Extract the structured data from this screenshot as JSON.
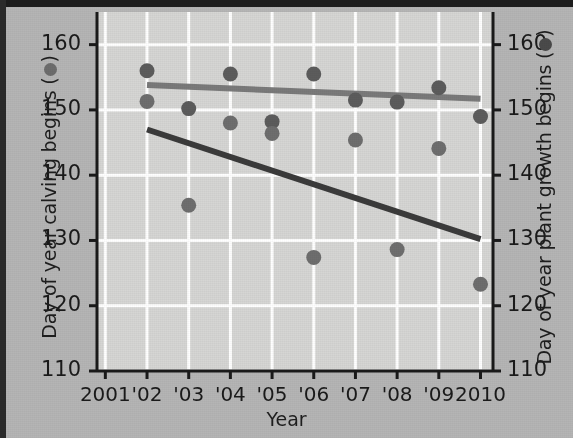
{
  "figure": {
    "background_color": "#b5b5b5",
    "plot_background_color": "#d6d6d4",
    "gridline_color": "#ffffff",
    "axis_color": "#1a1a1a"
  },
  "axes": {
    "x_label": "Year",
    "y_left_label_prefix": "Day of year calving begins (",
    "y_left_label_suffix": ")",
    "y_right_label_prefix": "Day of year plant growth begins (",
    "y_right_label_suffix": ")",
    "y_ticks": [
      "110",
      "120",
      "130",
      "140",
      "150",
      "160"
    ],
    "y_tick_values": [
      110,
      120,
      130,
      140,
      150,
      160
    ],
    "y_min": 110,
    "y_max": 165,
    "x_ticks": [
      "2001",
      "'02",
      "'03",
      "'04",
      "'05",
      "'06",
      "'07",
      "'08",
      "'09",
      "2010"
    ],
    "x_tick_values": [
      2001,
      2002,
      2003,
      2004,
      2005,
      2006,
      2007,
      2008,
      2009,
      2010
    ],
    "x_min": 2000.8,
    "x_max": 2010.3
  },
  "legend_symbols": {
    "calving_color": "#6d6d6d",
    "plant_growth_color": "#4a4a4a"
  },
  "chart_data": {
    "type": "scatter",
    "title": "",
    "xlabel": "Year",
    "ylabel": "Day of year calving begins",
    "ylabel_right": "Day of year plant growth begins",
    "xlim": [
      2000.8,
      2010.3
    ],
    "ylim": [
      110,
      165
    ],
    "grid": true,
    "legend_position": "axis-labels",
    "x": [
      2002,
      2003,
      2004,
      2005,
      2006,
      2007,
      2008,
      2009,
      2010
    ],
    "series": [
      {
        "name": "Day of year plant growth begins",
        "marker_color": "#5c5c5c",
        "values": [
          156.0,
          150.2,
          155.5,
          148.2,
          155.5,
          151.5,
          151.2,
          153.4,
          149.0
        ]
      },
      {
        "name": "Day of year calving begins",
        "marker_color": "#6e6e6e",
        "values": [
          151.3,
          135.4,
          148.0,
          146.4,
          127.4,
          145.4,
          128.6,
          144.1,
          123.3
        ]
      }
    ],
    "trendlines": [
      {
        "name": "plant growth begins trend",
        "color": "#7a7a7a",
        "x": [
          2002,
          2010
        ],
        "y": [
          153.8,
          151.7
        ]
      },
      {
        "name": "calving begins trend",
        "color": "#3b3b3b",
        "x": [
          2002,
          2010
        ],
        "y": [
          147.0,
          130.2
        ]
      }
    ]
  }
}
